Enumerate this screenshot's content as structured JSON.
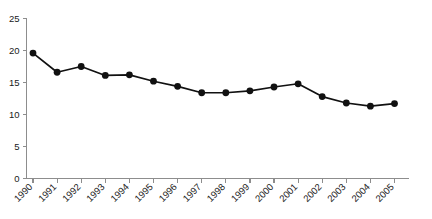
{
  "chart_data": {
    "type": "line",
    "title": "",
    "subtitle": "",
    "xlabel": "",
    "ylabel": "",
    "categories": [
      "1990",
      "1991",
      "1992",
      "1993",
      "1994",
      "1995",
      "1996",
      "1997",
      "1998",
      "1999",
      "2000",
      "2001",
      "2002",
      "2003",
      "2004",
      "2005"
    ],
    "values": [
      19.6,
      16.6,
      17.5,
      16.1,
      16.2,
      15.2,
      14.4,
      13.4,
      13.4,
      13.7,
      14.3,
      14.8,
      12.8,
      11.8,
      11.3,
      11.7
    ],
    "series": [
      {
        "name": "rate",
        "values": [
          19.6,
          16.6,
          17.5,
          16.1,
          16.2,
          15.2,
          14.4,
          13.4,
          13.4,
          13.7,
          14.3,
          14.8,
          12.8,
          11.8,
          11.3,
          11.7
        ]
      }
    ],
    "ylim": [
      0,
      25
    ],
    "yticks": [
      0,
      5,
      10,
      15,
      20,
      25
    ],
    "ytick_labels": [
      "0",
      "5",
      "10",
      "15",
      "20",
      "25"
    ],
    "xtick_labels": [
      "1990",
      "1991",
      "1992",
      "1993",
      "1994",
      "1995",
      "1996",
      "1997",
      "1998",
      "1999",
      "2000",
      "2001",
      "2002",
      "2003",
      "2004",
      "2005"
    ],
    "xtick_rotation": -45,
    "grid": false,
    "legend": false,
    "legend_position": "none",
    "marker": "circle",
    "line_color": "#111111",
    "marker_color": "#111111",
    "axis_color": "#8d8d8d",
    "background_color": "#ffffff"
  }
}
